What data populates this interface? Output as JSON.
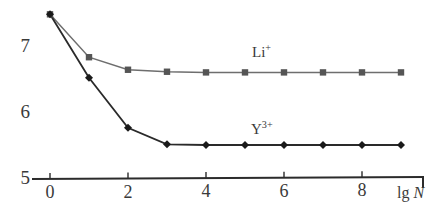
{
  "chart_data": {
    "type": "line",
    "title": "",
    "xlabel": "lg N",
    "ylabel": "",
    "x": [
      0,
      1,
      2,
      3,
      4,
      5,
      6,
      7,
      8,
      9
    ],
    "xlim": [
      -0.3,
      9.6
    ],
    "ylim": [
      5,
      7.6
    ],
    "grid": false,
    "legend_position": "inline-right-of-curves",
    "xticks": [
      "0",
      "2",
      "4",
      "6",
      "8"
    ],
    "xtick_values": [
      0,
      2,
      4,
      6,
      8
    ],
    "yticks": [
      "7",
      "6",
      "5"
    ],
    "ytick_values": [
      7,
      6,
      5
    ],
    "series": [
      {
        "name": "Li+",
        "label": "Li",
        "charge": "+",
        "marker": "square",
        "color": "#555555",
        "line_color": "#6e6e6e",
        "values": [
          7.48,
          6.83,
          6.64,
          6.61,
          6.6,
          6.6,
          6.6,
          6.6,
          6.6,
          6.6
        ]
      },
      {
        "name": "Y3+",
        "label": "Y",
        "charge": "3+",
        "marker": "diamond",
        "color": "#1a1a1a",
        "line_color": "#2a2a2a",
        "values": [
          7.48,
          6.52,
          5.76,
          5.51,
          5.5,
          5.5,
          5.5,
          5.5,
          5.5,
          5.5
        ]
      }
    ],
    "annotations": [
      {
        "text": "Li+",
        "x": 5.3,
        "y": 6.95
      },
      {
        "text": "Y3+",
        "x": 5.3,
        "y": 5.85
      }
    ]
  },
  "axes": {
    "x_title_prefix": "lg",
    "x_title_symbol": "N",
    "y_labels": [
      "7",
      "6",
      "5"
    ],
    "x_labels": [
      "0",
      "2",
      "4",
      "6",
      "8"
    ],
    "axis_color": "#2b2b2b"
  },
  "labels": {
    "li_base": "Li",
    "li_sup": "+",
    "y_base": "Y",
    "y_sup": "3+"
  }
}
